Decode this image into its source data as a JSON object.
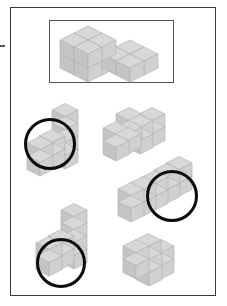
{
  "page": {
    "background_color": "#ffffff",
    "border_color": "#3a3a3a",
    "width": 227,
    "height": 306
  },
  "reference": {
    "frame_label": "reference-figure-frame",
    "border_color": "#555555",
    "figure": {
      "name": "L-shaped block, 2 high on left, 1 high on right",
      "cube_count": 10,
      "cube_fill": "#c9c9c9"
    }
  },
  "colors": {
    "cube_top": "#d5d5d5",
    "cube_left": "#c2c2c2",
    "cube_right": "#cfcfcf",
    "cube_edge": "#b0b0b0",
    "annotation": "#0c0c0c",
    "frame": "#555555",
    "page_border": "#3a3a3a"
  },
  "annotations": {
    "circle_stroke_width": 3,
    "circle_color": "#0c0c0c",
    "count": 3
  },
  "figures": [
    {
      "id": "figure-1",
      "position": "upper-left",
      "description": "Tall stepped block: column of cubes with a 2x2 block at the lower left",
      "annotated": true,
      "circle": {
        "cx": 50,
        "cy": 144,
        "r": 26
      }
    },
    {
      "id": "figure-2",
      "position": "upper-right",
      "description": "Stepped L-block lying horizontally, two levels",
      "annotated": false,
      "circle": null
    },
    {
      "id": "figure-3",
      "position": "middle-right",
      "description": "L-shaped block, low arm to the left with upright column on the right",
      "annotated": true,
      "circle": {
        "cx": 172,
        "cy": 196,
        "r": 26
      }
    },
    {
      "id": "figure-4",
      "position": "lower-left",
      "description": "Tall stepped block with base block at bottom left",
      "annotated": true,
      "circle": {
        "cx": 61,
        "cy": 263,
        "r": 25
      }
    },
    {
      "id": "figure-5",
      "position": "lower-right",
      "description": "Solid 2x2x2 cube",
      "annotated": false,
      "circle": null
    }
  ]
}
